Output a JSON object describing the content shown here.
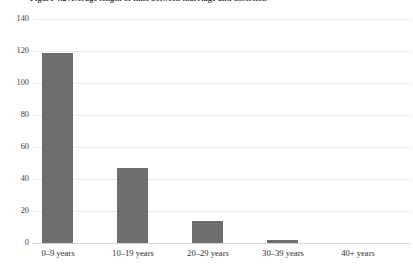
{
  "chart_data": {
    "type": "bar",
    "title": "Figure 4.2 Average length of time between marriage and desertion",
    "xlabel": "",
    "ylabel": "",
    "categories": [
      "0–9 years",
      "10–19 years",
      "20–29 years",
      "30–39 years",
      "40+ years"
    ],
    "values": [
      119,
      47,
      14,
      2,
      0
    ],
    "series": [
      {
        "name": "Cases",
        "values": [
          119,
          47,
          14,
          2,
          0
        ]
      }
    ],
    "ylim": [
      0,
      140
    ],
    "yticks": [
      0,
      20,
      40,
      60,
      80,
      100,
      120,
      140
    ],
    "ytick_labels": [
      "0",
      "20",
      "40",
      "60",
      "80",
      "100",
      "120",
      "140"
    ],
    "grid": true,
    "legend": false,
    "legend_position": "none",
    "bar_color": "#6e6e6e",
    "gridline_color": "#ececec",
    "axis_color": "#d3d3d3",
    "background_color": "#ffffff"
  },
  "axis": {
    "y_tick_0": "0",
    "y_tick_1": "20",
    "y_tick_2": "40",
    "y_tick_3": "60",
    "y_tick_4": "80",
    "y_tick_5": "100",
    "y_tick_6": "120",
    "y_tick_7": "140",
    "x_tick_0": "0–9 years",
    "x_tick_1": "10–19 years",
    "x_tick_2": "20–29 years",
    "x_tick_3": "30–39 years",
    "x_tick_4": "40+ years"
  }
}
